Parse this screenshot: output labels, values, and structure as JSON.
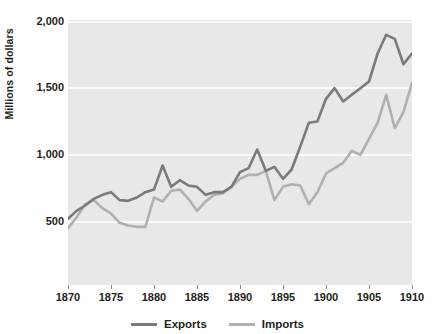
{
  "chart_data": {
    "type": "line",
    "title": "",
    "subtitle": "",
    "xlabel": "",
    "ylabel": "Millions of dollars",
    "xlim": [
      1870,
      1910
    ],
    "ylim": [
      0,
      2000
    ],
    "yticks": [
      "2,000",
      "1,500",
      "1,000",
      "500"
    ],
    "ytick_values": [
      2000,
      1500,
      1000,
      500
    ],
    "xticks": [
      "1870",
      "1875",
      "1880",
      "1885",
      "1890",
      "1895",
      "1900",
      "1905",
      "1910"
    ],
    "xtick_values": [
      1870,
      1875,
      1880,
      1885,
      1890,
      1895,
      1900,
      1905,
      1910
    ],
    "grid": "horizontal",
    "legend_position": "bottom",
    "plot_background": "#e8e8e8",
    "gridline_color": "#fbfbfb",
    "x": [
      1870,
      1871,
      1872,
      1873,
      1874,
      1875,
      1876,
      1877,
      1878,
      1879,
      1880,
      1881,
      1882,
      1883,
      1884,
      1885,
      1886,
      1887,
      1888,
      1889,
      1890,
      1891,
      1892,
      1893,
      1894,
      1895,
      1896,
      1897,
      1898,
      1899,
      1900,
      1901,
      1902,
      1903,
      1904,
      1905,
      1906,
      1907,
      1908,
      1909,
      1910
    ],
    "series": [
      {
        "name": "Exports",
        "color": "#7a7a7a",
        "values": [
          520,
          580,
          620,
          670,
          700,
          720,
          660,
          655,
          680,
          720,
          740,
          920,
          760,
          810,
          770,
          760,
          700,
          720,
          720,
          760,
          870,
          900,
          1040,
          880,
          910,
          820,
          890,
          1060,
          1240,
          1250,
          1420,
          1500,
          1400,
          1450,
          1500,
          1550,
          1760,
          1900,
          1870,
          1680,
          1760
        ]
      },
      {
        "name": "Imports",
        "color": "#b0b0b0",
        "values": [
          450,
          530,
          630,
          660,
          600,
          560,
          490,
          470,
          460,
          460,
          680,
          650,
          730,
          740,
          670,
          580,
          650,
          700,
          710,
          760,
          820,
          850,
          850,
          880,
          660,
          760,
          780,
          770,
          630,
          720,
          860,
          900,
          940,
          1030,
          1000,
          1120,
          1240,
          1450,
          1200,
          1320,
          1540
        ]
      }
    ]
  },
  "axis": {
    "ylabel": "Millions of dollars"
  },
  "legend": {
    "entries": [
      {
        "label": "Exports",
        "color": "#7a7a7a"
      },
      {
        "label": "Imports",
        "color": "#b0b0b0"
      }
    ]
  }
}
